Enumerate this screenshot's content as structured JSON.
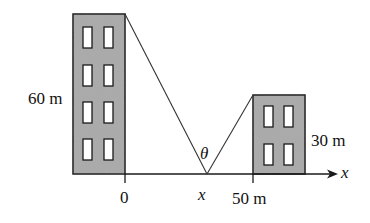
{
  "diagram": {
    "type": "geometry-figure",
    "colors": {
      "building_fill": "#a9a9a9",
      "outline": "#1a1a1a",
      "window_fill": "#ffffff",
      "background": "#ffffff"
    },
    "left_building": {
      "height_label": "60 m",
      "window_rows": 4,
      "window_cols": 2
    },
    "right_building": {
      "height_label": "30 m",
      "window_rows": 2,
      "window_cols": 2
    },
    "axis": {
      "label": "x",
      "origin_label": "0",
      "tick_label": "50 m",
      "point_label": "x"
    },
    "angle_label": "θ"
  }
}
